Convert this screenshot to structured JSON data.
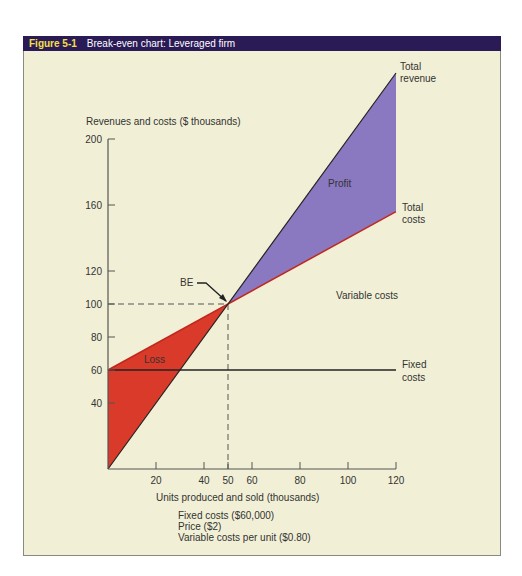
{
  "figure": {
    "number": "Figure 5-1",
    "title": "Break-even chart: Leveraged firm"
  },
  "notes": [
    "Fixed costs ($60,000)",
    "Price ($2)",
    "Variable costs per unit ($0.80)"
  ],
  "colors": {
    "header_bg": "#2a1a55",
    "loss": "#d93a2a",
    "profit": "#8a78c0",
    "total_costs_line": "#c0281e",
    "background": "#f1f0d6"
  },
  "chart_data": {
    "type": "line",
    "title": "Break-even chart: Leveraged firm",
    "xlabel": "Units produced and sold (thousands)",
    "ylabel": "Revenues and costs ($ thousands)",
    "xlim": [
      0,
      120
    ],
    "ylim": [
      0,
      200
    ],
    "xticks": [
      20,
      40,
      50,
      60,
      80,
      100,
      120
    ],
    "yticks": [
      40,
      60,
      80,
      100,
      120,
      160,
      200
    ],
    "series": [
      {
        "name": "Total revenue",
        "x": [
          0,
          120
        ],
        "y": [
          0,
          240
        ]
      },
      {
        "name": "Total costs",
        "x": [
          0,
          120
        ],
        "y": [
          60,
          156
        ]
      },
      {
        "name": "Fixed costs",
        "x": [
          0,
          120
        ],
        "y": [
          60,
          60
        ]
      }
    ],
    "break_even": {
      "label": "BE",
      "x": 50,
      "y": 100
    },
    "regions": [
      {
        "label": "Loss",
        "from_x": 0,
        "to_x": 50
      },
      {
        "label": "Profit",
        "from_x": 50,
        "to_x": 120
      }
    ],
    "annotations": {
      "total_revenue": [
        "Total",
        "revenue"
      ],
      "total_costs": [
        "Total",
        "costs"
      ],
      "variable_costs": "Variable costs",
      "fixed_costs": [
        "Fixed",
        "costs"
      ]
    }
  }
}
